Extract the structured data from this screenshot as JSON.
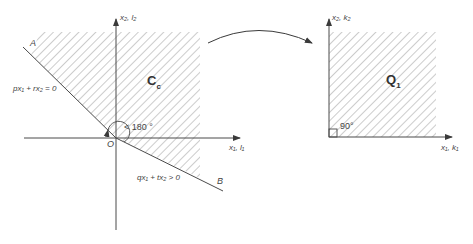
{
  "left_panel": {
    "y_axis_label": "x₂, l₂",
    "x_axis_label": "x₁, l₁",
    "origin_label": "O",
    "point_a_label": "A",
    "point_b_label": "B",
    "line_a_equation": "px₁ + rx₂ = 0",
    "line_b_inequality": "qx₁ + tx₂ > 0",
    "angle_label": "< 180 °",
    "region_label": "C",
    "region_subscript": "c"
  },
  "right_panel": {
    "y_axis_label": "x₂, k₂",
    "x_axis_label": "x₁, k₁",
    "angle_label": "90°",
    "region_label": "Q",
    "region_subscript": "1"
  },
  "mapping_arrow": {
    "direction": "left-to-right"
  },
  "colors": {
    "line": "#4a4a4a",
    "hatch": "#9a9a9a",
    "background": "#ffffff"
  }
}
